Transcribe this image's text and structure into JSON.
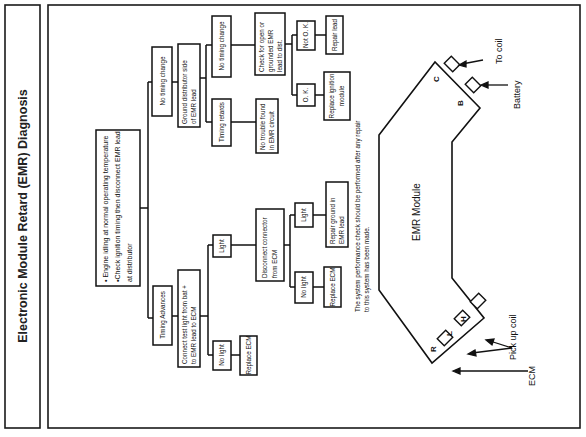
{
  "title": "Electronic Module Retard (EMR) Diagnosis",
  "flowchart": {
    "root": {
      "lines": [
        "• Engine idling at normal operating temperature",
        "•Check ignition timing  then disconnect EMR lead",
        "  at distributor"
      ]
    },
    "left_branch": {
      "label": "Timing Advances",
      "step": {
        "lines": [
          "Connect test light from bat +",
          "to EMR lead to ECM"
        ]
      },
      "no_light": {
        "label": "No light",
        "action": "Replace ECM"
      },
      "light": {
        "label": "Light",
        "step": {
          "lines": [
            "Disconnect connector",
            "from ECM"
          ]
        },
        "no_light": {
          "label": "No light",
          "action": "Replace ECM"
        },
        "light": {
          "label": "Light",
          "action_lines": [
            "Repair ground in",
            "EMR lead"
          ]
        }
      }
    },
    "right_branch": {
      "label": "No timing change",
      "step": {
        "lines": [
          "Ground distributor side",
          "of EMR lead"
        ]
      },
      "timing_retards": {
        "label": "Timing retards",
        "result_lines": [
          "No trouble found",
          "in EMR circuit"
        ]
      },
      "no_timing_change": {
        "label": "No timing change",
        "step": {
          "lines": [
            "Check for open or",
            "grounded EMR",
            "lead to dist."
          ]
        },
        "ok": {
          "label": "O. K.",
          "action_lines": [
            "Replace ignition",
            "module"
          ]
        },
        "not_ok": {
          "label": "Not O. K.",
          "action": "Repair lead"
        }
      }
    },
    "note_lines": [
      "The system performance check should be performed after any repair",
      "to this system has been made."
    ]
  },
  "module": {
    "label": "EMR Module",
    "pins": [
      "C",
      "B",
      "R",
      "L",
      "H"
    ],
    "callouts": {
      "to_coil": "To coil",
      "battery": "Battery",
      "pick_up_coil": "Pick up coil",
      "ecm": "ECM"
    }
  }
}
